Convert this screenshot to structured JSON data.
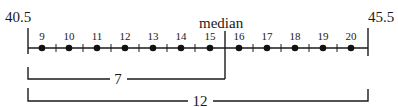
{
  "diagram": {
    "title_fragment": "",
    "left_boundary_label": "40.5",
    "right_boundary_label": "45.5",
    "median_label": "median",
    "points": [
      {
        "label": "9"
      },
      {
        "label": "10"
      },
      {
        "label": "11"
      },
      {
        "label": "12"
      },
      {
        "label": "13"
      },
      {
        "label": "14"
      },
      {
        "label": "15"
      },
      {
        "label": "16"
      },
      {
        "label": "17"
      },
      {
        "label": "18"
      },
      {
        "label": "19"
      },
      {
        "label": "20"
      }
    ],
    "brackets": {
      "lower_half": {
        "label": "7"
      },
      "total": {
        "label": "12"
      }
    }
  }
}
